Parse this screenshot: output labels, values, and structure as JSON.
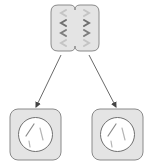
{
  "diagram": {
    "type": "cell-division",
    "colors": {
      "cell_fill": "#e4e4e4",
      "cell_stroke": "#8a8a8a",
      "nucleus_fill": "#ffffff",
      "nucleus_stroke": "#707070",
      "chromosome_dark": "#6f6f6f",
      "chromosome_light": "#b8b8b8",
      "arrow": "#444444"
    },
    "parent_cell": {
      "label": "",
      "stage": "dividing",
      "chromosome_rows": 4
    },
    "daughter_cells": [
      {
        "label": ""
      },
      {
        "label": ""
      }
    ]
  }
}
